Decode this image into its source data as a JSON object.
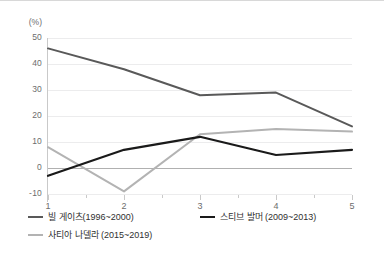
{
  "unit_label": "(%)",
  "colors": {
    "gates": "#595959",
    "ballmer": "#1a1a1a",
    "nadella": "#b3b3b3",
    "grid": "#ececed",
    "zero_line": "#b0b0b0",
    "axis": "#c9c9c9",
    "tick_text": "#6d6d6d",
    "legend_text": "#2f2f2f",
    "top_rule": "#d8d8d8"
  },
  "legend": {
    "items": [
      {
        "label": "빌 게이츠(1996~2000)",
        "color": "#595959"
      },
      {
        "label": "스티브 발머 (2009~2013)",
        "color": "#1a1a1a"
      },
      {
        "label": "사티아 나델라 (2015~2019)",
        "color": "#b3b3b3"
      }
    ]
  },
  "chart_data": {
    "type": "line",
    "title": "",
    "xlabel": "",
    "ylabel": "(%)",
    "x": [
      1,
      2,
      3,
      4,
      5
    ],
    "xtick_labels": [
      "1",
      "2",
      "3",
      "4",
      "5"
    ],
    "ytick_labels": [
      "50",
      "40",
      "30",
      "20",
      "10",
      "0",
      "-10"
    ],
    "yticks": [
      50,
      40,
      30,
      20,
      10,
      0,
      -10
    ],
    "ylim": [
      -10,
      50
    ],
    "xlim": [
      1,
      5
    ],
    "grid": true,
    "zero_line": true,
    "legend_position": "bottom-left",
    "series": [
      {
        "name": "빌 게이츠(1996~2000)",
        "color": "#595959",
        "values": [
          46,
          38,
          28,
          29,
          16
        ]
      },
      {
        "name": "스티브 발머 (2009~2013)",
        "color": "#1a1a1a",
        "values": [
          -3,
          7,
          12,
          5,
          7
        ]
      },
      {
        "name": "사티아 나델라 (2015~2019)",
        "color": "#b3b3b3",
        "values": [
          8,
          -9,
          13,
          15,
          14
        ]
      }
    ]
  }
}
